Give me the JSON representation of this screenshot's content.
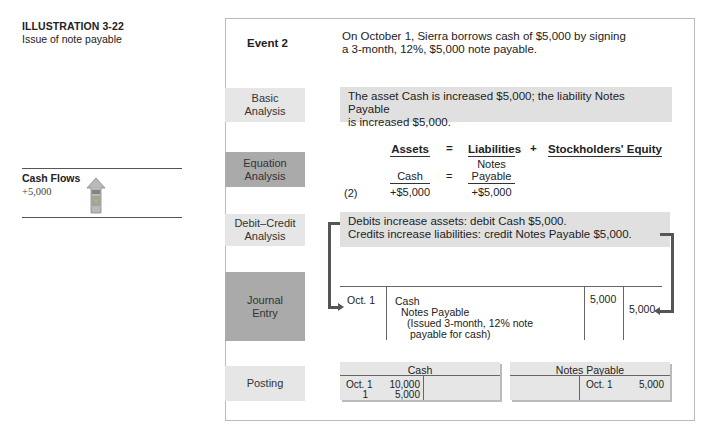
{
  "illustration": {
    "title": "ILLUSTRATION 3-22",
    "subtitle": "Issue of note payable"
  },
  "cash_flows": {
    "title": "Cash Flows",
    "value": "+5,000",
    "icon": "cash-increase-arrow-icon"
  },
  "event": {
    "label": "Event 2",
    "line1": "On October 1, Sierra borrows cash of $5,000 by signing",
    "line2": "a 3-month, 12%, $5,000 note payable."
  },
  "basic_analysis": {
    "label_line1": "Basic",
    "label_line2": "Analysis",
    "line1": "The asset Cash is increased $5,000; the liability Notes Payable",
    "line2": "is increased $5,000."
  },
  "equation_analysis": {
    "label_line1": "Equation",
    "label_line2": "Analysis",
    "headers": {
      "assets": "Assets",
      "eq": "=",
      "liabilities": "Liabilities",
      "plus": "+",
      "equity": "Stockholders' Equity"
    },
    "row_label": "(2)",
    "assets_account": "Cash",
    "liab_account_line1": "Notes",
    "liab_account_line2": "Payable",
    "eq_sign": "=",
    "assets_change": "+$5,000",
    "liab_change": "+$5,000"
  },
  "debit_credit": {
    "label_line1": "Debit–Credit",
    "label_line2": "Analysis",
    "line1": "Debits increase assets: debit Cash $5,000.",
    "line2": "Credits increase liabilities: credit Notes Payable $5,000."
  },
  "journal_entry": {
    "label_line1": "Journal",
    "label_line2": "Entry",
    "date": "Oct. 1",
    "debit_account": "Cash",
    "credit_account": "Notes Payable",
    "explanation_line1": "(Issued 3-month, 12% note",
    "explanation_line2": "payable for cash)",
    "debit_amount": "5,000",
    "credit_amount": "5,000"
  },
  "posting": {
    "label": "Posting",
    "cash_account": {
      "title": "Cash",
      "debits": [
        {
          "date": "Oct. 1",
          "amount": "10,000"
        },
        {
          "date": "1",
          "amount": "5,000"
        }
      ]
    },
    "notes_payable_account": {
      "title": "Notes Payable",
      "credits": [
        {
          "date": "Oct. 1",
          "amount": "5,000"
        }
      ]
    }
  },
  "colors": {
    "light_box": "#e6e6e6",
    "dark_box": "#aaaaaa",
    "arrow": "#555555"
  }
}
